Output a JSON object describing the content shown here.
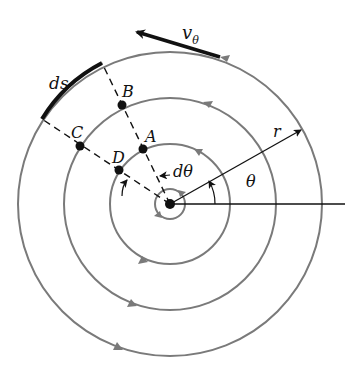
{
  "figure": {
    "center": [
      170,
      204
    ],
    "streamline_radii": [
      15,
      60,
      106,
      152
    ],
    "colors": {
      "streamline": "#7a7a7a",
      "ink": "#111111"
    }
  },
  "labels": {
    "ds": "ds",
    "B": "B",
    "A": "A",
    "C": "C",
    "D": "D",
    "dtheta": "dθ",
    "r": "r",
    "theta": "θ",
    "v_theta_main": "v",
    "v_theta_sub": "θ"
  },
  "points": {
    "A": [
      143,
      149
    ],
    "B": [
      122,
      105
    ],
    "C": [
      80,
      146
    ],
    "D": [
      119,
      170
    ]
  }
}
